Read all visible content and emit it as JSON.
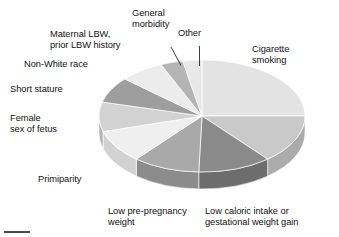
{
  "figure": {
    "background": "#ffffff",
    "text_color": "#121212"
  },
  "chart_data": {
    "type": "pie",
    "title": "",
    "subtitle": "",
    "xlabel": "",
    "ylabel": "",
    "legend_position": "around-perimeter-with-leader-lines",
    "grid": false,
    "three_d": true,
    "start_angle_deg": 0,
    "direction": "clockwise",
    "categories": [
      "Cigarette smoking",
      "Low caloric intake or gestational weight gain",
      "Low pre-pregnancy weight",
      "Primiparity",
      "Female sex of fetus",
      "Short stature",
      "Non-White race",
      "Maternal LBW, prior LBW history",
      "General morbidity",
      "Other"
    ],
    "values": [
      25.0,
      14.0,
      11.5,
      10.5,
      9.5,
      8.5,
      7.5,
      7.0,
      3.5,
      3.0
    ],
    "units": "percent",
    "colors": [
      "#e3e3e3",
      "#c9c9c9",
      "#8a8a8a",
      "#a9a9a9",
      "#efefef",
      "#d2d2d2",
      "#9e9e9e",
      "#ececec",
      "#b4b4b4",
      "#e8e8e8"
    ],
    "side_colors": [
      "#c6c6c6",
      "#ababab",
      "#6d6d6d",
      "#8c8c8c",
      "#d2d2d2",
      "#b5b5b5",
      "#828282",
      "#cfcfcf",
      "#979797",
      "#cbcbcb"
    ]
  },
  "labels": {
    "cigarette_smoking": "Cigarette\nsmoking",
    "low_caloric": "Low caloric intake or\ngestational weight gain",
    "low_pre_pregnancy": "Low pre-pregnancy\nweight",
    "primiparity": "Primiparity",
    "female_sex_of_fetus": "Female\nsex of fetus",
    "short_stature": "Short stature",
    "non_white_race": "Non-White race",
    "maternal_lbw": "Maternal LBW,\nprior LBW history",
    "general_morbidity": "General\nmorbidity",
    "other": "Other"
  }
}
